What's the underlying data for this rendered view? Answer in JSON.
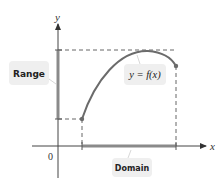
{
  "diagram": {
    "axes": {
      "x_label": "x",
      "y_label": "y",
      "origin_label": "0"
    },
    "function_label": "y = f(x)",
    "range_label": "Range",
    "domain_label": "Domain",
    "colors": {
      "axis": "#333333",
      "curve": "#6b6b6b",
      "bar": "#8a8a8a",
      "dashed": "#555555",
      "bubble": "#efefef"
    }
  }
}
